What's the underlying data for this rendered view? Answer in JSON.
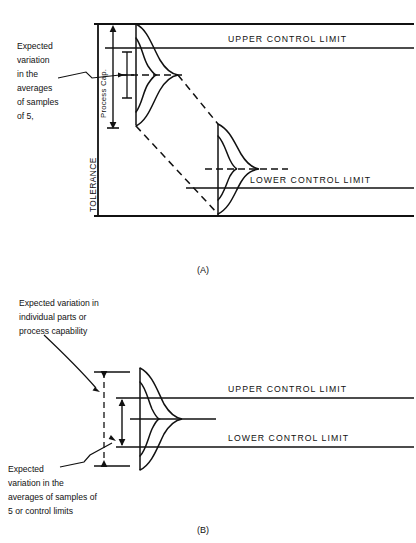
{
  "figure": {
    "panel_a": {
      "caption": "(A)",
      "axis_labels": {
        "tolerance": "TOLERANCE",
        "process_cap": "Process Cap."
      },
      "limits": {
        "upper": "UPPER CONTROL LIMIT",
        "lower": "LOWER CONTROL LIMIT"
      },
      "annotation": {
        "lines": [
          "Expected",
          "variation",
          "in  the",
          "averages",
          "of  samples",
          "of  5,"
        ]
      }
    },
    "panel_b": {
      "caption": "(B)",
      "limits": {
        "upper": "UPPER CONTROL LIMIT",
        "lower": "LOWER CONTROL LIMIT"
      },
      "annotation_top": {
        "lines": [
          "Expected  variation  in",
          "individual  parts  or",
          "process  capability"
        ]
      },
      "annotation_bottom": {
        "lines": [
          "Expected",
          "variation  in  the",
          "averages  of  samples  of",
          "5  or  control  limits"
        ]
      }
    },
    "colors": {
      "ink": "#111111",
      "background": "#ffffff"
    }
  }
}
